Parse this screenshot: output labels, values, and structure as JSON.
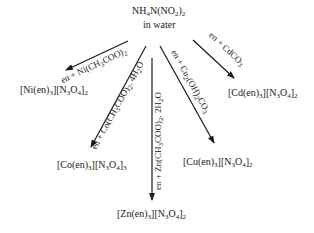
{
  "reactant": {
    "formula_parts": [
      "NH",
      "4",
      "N(NO",
      "2",
      ")",
      "2"
    ],
    "formula": "NH4N(NO2)2",
    "solvent": "in water"
  },
  "branches": [
    {
      "id": "ni",
      "reagent": "en + Ni(CH3COO)2",
      "reagent_parts": [
        "en + Ni(CH",
        "3",
        "COO)",
        "2"
      ],
      "product": "[Ni(en)3][N3O4]2",
      "product_parts": [
        "[Ni(en)",
        "3",
        "][N",
        "3",
        "O",
        "4",
        "]",
        "2"
      ]
    },
    {
      "id": "co",
      "reagent": "en + Co(CH3COO)2.4H2O",
      "reagent_parts": [
        "en + Co(CH",
        "3",
        "COO)",
        "2",
        ". 4H",
        "2",
        "O"
      ],
      "product": "[Co(en)3][N3O4]3",
      "product_parts": [
        "[Co(en)",
        "3",
        "][N",
        "3",
        "O",
        "4",
        "]",
        "3"
      ]
    },
    {
      "id": "zn",
      "reagent": "en + Zn(CH3COO)2. 2H2O",
      "reagent_parts": [
        "en + Zn(CH",
        "3",
        "COO)",
        "2",
        ". 2H",
        "2",
        "O"
      ],
      "product": "[Zn(en)3][N3O4]2",
      "product_parts": [
        "[Zn(en)",
        "3",
        "][N",
        "3",
        "O",
        "4",
        "]",
        "2"
      ]
    },
    {
      "id": "cu",
      "reagent": "en + Cu2(OH)2CO3",
      "reagent_parts": [
        "en + Cu",
        "2",
        "(OH)",
        "2",
        "CO",
        "3"
      ],
      "product": "[Cu(en)3][N3O4]2",
      "product_parts": [
        "[Cu(en)",
        "3",
        "][N",
        "3",
        "O",
        "4",
        "]",
        "2"
      ]
    },
    {
      "id": "cd",
      "reagent": "en + CdCO3",
      "reagent_parts": [
        "en + CdCO",
        "3"
      ],
      "product": "[Cd(en)3][N3O4]2",
      "product_parts": [
        "[Cd(en)",
        "3",
        "][N",
        "3",
        "O",
        "4",
        "]",
        "2"
      ]
    }
  ],
  "colors": {
    "ink": "#1a1a1a",
    "background": "#ffffff"
  }
}
